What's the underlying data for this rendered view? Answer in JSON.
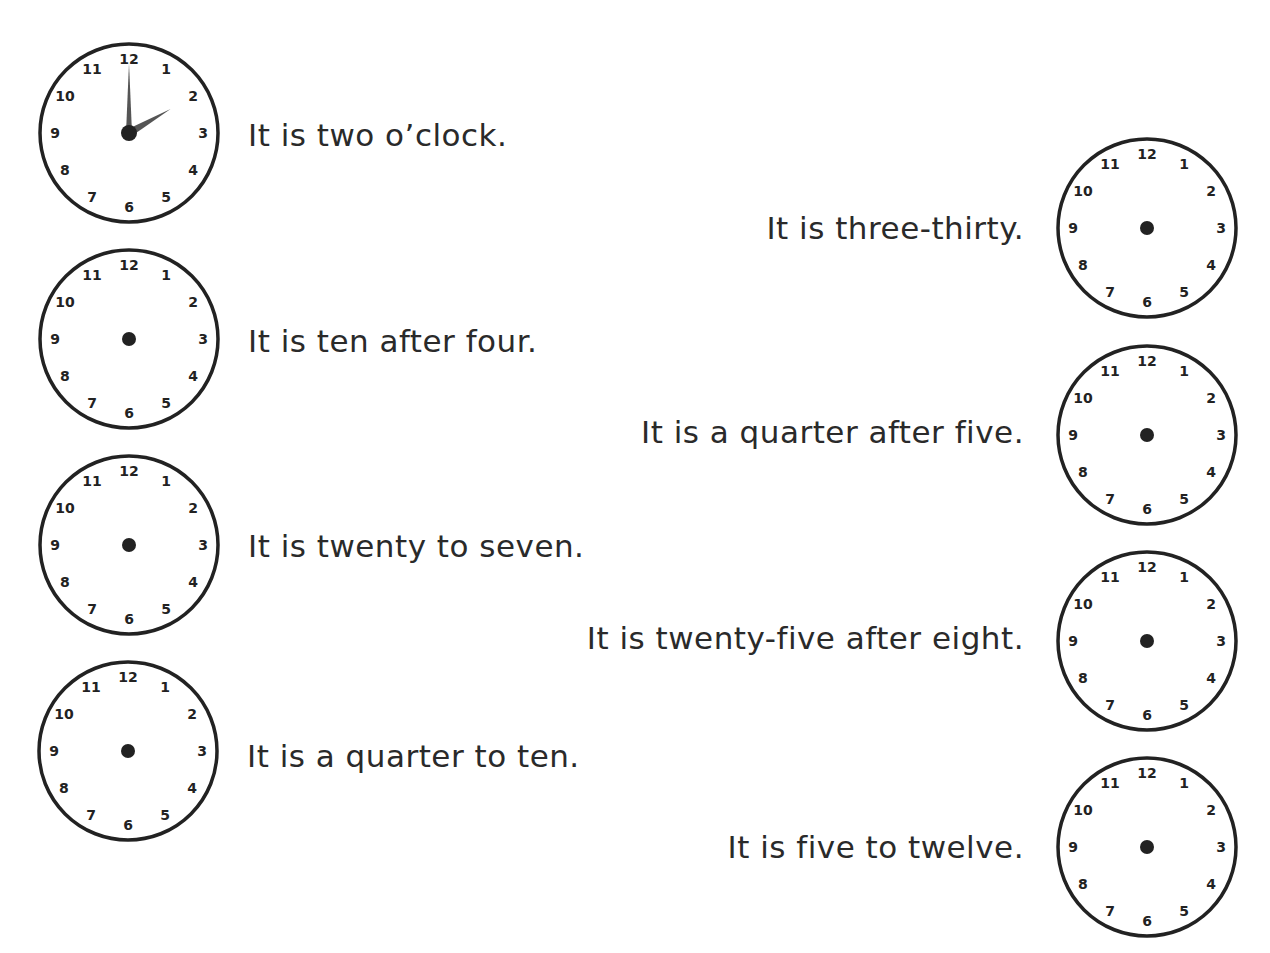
{
  "worksheet": {
    "clock_numbers": [
      "12",
      "1",
      "2",
      "3",
      "4",
      "5",
      "6",
      "7",
      "8",
      "9",
      "10",
      "11"
    ],
    "left_items": [
      {
        "text": "It is two o’clock.",
        "hands": {
          "hour": 2,
          "minute": 0
        }
      },
      {
        "text": "It is ten after four.",
        "hands": null
      },
      {
        "text": "It is twenty to seven.",
        "hands": null
      },
      {
        "text": "It is a quarter to ten.",
        "hands": null
      }
    ],
    "right_items": [
      {
        "text": "It is three-thirty.",
        "hands": null
      },
      {
        "text": "It is a quarter after five.",
        "hands": null
      },
      {
        "text": "It is twenty-five after eight.",
        "hands": null
      },
      {
        "text": "It is five to twelve.",
        "hands": null
      }
    ],
    "colors": {
      "ink": "#222222",
      "hand": "#555555",
      "background": "#ffffff"
    }
  }
}
